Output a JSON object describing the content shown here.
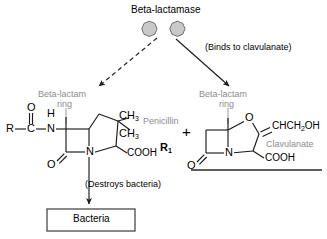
{
  "diagram": {
    "type": "biochemistry-mechanism",
    "title": "Beta-lactamase",
    "enzyme": {
      "label": "Beta-lactamase",
      "shape": "two-gray-octagons",
      "fill_color": "#c9c9c9",
      "stroke_color": "#6e6e6e",
      "count": 2
    },
    "arrows": [
      {
        "name": "arrow-to-penicillin",
        "style": "dashed",
        "direction": "down-left",
        "meaning": "beta-lactamase degrades penicillin"
      },
      {
        "name": "arrow-to-clavulanate",
        "style": "solid",
        "direction": "down-right",
        "label": "(Binds to clavulanate)"
      },
      {
        "name": "arrow-penicillin-to-bacteria",
        "style": "solid",
        "direction": "down",
        "label": "(Destroys bacteria)"
      }
    ],
    "annotations": {
      "binds_to_clavulanate": "(Binds to clavulanate)",
      "destroys_bacteria": "(Destroys bacteria)"
    },
    "plus_sign": "+",
    "bacteria_box": {
      "label": "Bacteria",
      "border_color": "#4a4a4a"
    }
  },
  "molecules": {
    "penicillin": {
      "name_label": "Penicillin",
      "name_color": "#8c8c8c",
      "ring_label_line1": "Beta-lactam",
      "ring_label_line2": "ring",
      "ring_label_color": "#8c8c8c",
      "atoms": {
        "r_group": "R",
        "carbonyl_c": "C",
        "carbonyl_o": "O",
        "amide_n": "N",
        "amide_h": "H",
        "lactam_o": "O",
        "ring_n": "N",
        "methyl_1": "CH",
        "methyl_1_sub": "3",
        "methyl_2": "CH",
        "methyl_2_sub": "3",
        "carboxyl": "COOH"
      },
      "side_label": "R",
      "side_label_sub": "1"
    },
    "clavulanate": {
      "name_label": "Clavulanate",
      "name_color": "#8c8c8c",
      "ring_label_line1": "Beta-lactam",
      "ring_label_line2": "ring",
      "ring_label_color": "#8c8c8c",
      "atoms": {
        "ring_o": "O",
        "lactam_o": "O",
        "ring_n": "N",
        "side_chain": "CHCH",
        "side_chain_sub": "2",
        "side_chain_tail": "OH",
        "carboxyl": "COOH"
      },
      "underline": true
    }
  },
  "colors": {
    "ink": "#000000",
    "gray_text": "#8c8c8c",
    "bond": "#1a1a1a",
    "enzyme_fill": "#c9c9c9",
    "enzyme_stroke": "#6e6e6e",
    "box_border": "#4a4a4a",
    "background": "#ffffff"
  }
}
